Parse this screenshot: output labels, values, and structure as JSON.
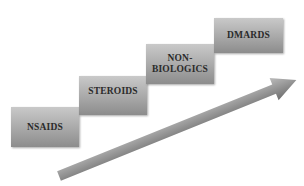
{
  "diagram": {
    "type": "staircase-progression",
    "steps": [
      {
        "label": "NSAIDS"
      },
      {
        "label": "STEROIDS"
      },
      {
        "label": "NON-\nBIOLOGICS"
      },
      {
        "label": "DMARDS"
      }
    ],
    "arrow": {
      "direction": "up-right",
      "color": "#8a8a8a"
    }
  }
}
